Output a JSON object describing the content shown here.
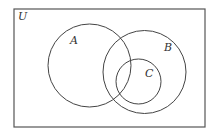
{
  "diagram": {
    "type": "venn",
    "universe": {
      "label": "U",
      "x": 14,
      "y": 9,
      "width": 191,
      "height": 118
    },
    "sets": [
      {
        "label": "A",
        "cx": 89.5,
        "cy": 65.5,
        "r": 41.5,
        "label_x": 70,
        "label_y": 44
      },
      {
        "label": "B",
        "cx": 144.5,
        "cy": 72,
        "r": 41.5,
        "label_x": 164,
        "label_y": 51
      },
      {
        "label": "C",
        "cx": 138.5,
        "cy": 81.5,
        "r": 22.5,
        "label_x": 145,
        "label_y": 77
      }
    ],
    "colors": {
      "stroke": "#444444",
      "background": "#ffffff",
      "text": "#333333"
    }
  }
}
